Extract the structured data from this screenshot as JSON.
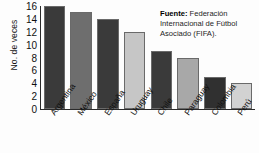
{
  "chart_data": {
    "type": "bar",
    "title": "",
    "subtitle": "",
    "xlabel": "",
    "ylabel": "No. de veces",
    "ylim": [
      0,
      16
    ],
    "ytick_step": 2,
    "grid": false,
    "legend": "none",
    "categories": [
      "Argentina",
      "México",
      "España",
      "Uruguay",
      "Chile",
      "Paraguay",
      "Colombia",
      "Perú"
    ],
    "values": [
      16,
      15,
      14,
      12,
      9,
      8,
      5,
      4
    ],
    "ytick_labels": [
      "16",
      "14",
      "12",
      "10",
      "8",
      "6",
      "4",
      "2",
      "0"
    ],
    "bar_colors": [
      "#3a3a3a",
      "#6e6e6e",
      "#3a3a3a",
      "#c6c6c6",
      "#3a3a3a",
      "#a8a8a8",
      "#303030",
      "#d2d2d2"
    ],
    "bar_border_color": "#6a6a6a",
    "axis_color": "#2a2a2a",
    "background_color": "#fdfdfd",
    "annotations": [
      {
        "name": "source-note",
        "label": "Fuente:",
        "text": "Federación Internacional de Fútbol Asociado (FIFA)."
      }
    ]
  },
  "source": {
    "label": "Fuente:",
    "text": "Federación Internacional de Fútbol Asociado (FIFA)."
  }
}
